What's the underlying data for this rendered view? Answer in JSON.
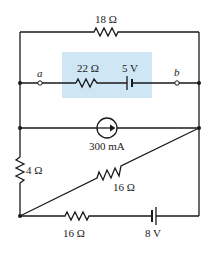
{
  "diagram": {
    "type": "circuit",
    "highlight_color": "#cfe6f5",
    "wire_color": "#1a1a1a",
    "components": {
      "r_top": {
        "label": "18 Ω",
        "type": "resistor"
      },
      "r_mid": {
        "label": "22 Ω",
        "type": "resistor"
      },
      "v_mid": {
        "label": "5 V",
        "type": "battery"
      },
      "i_src": {
        "label": "300 mA",
        "type": "current-source",
        "direction": "right"
      },
      "r_left": {
        "label": "4 Ω",
        "type": "resistor"
      },
      "r_diag": {
        "label": "16 Ω",
        "type": "resistor"
      },
      "r_bot": {
        "label": "16 Ω",
        "type": "resistor"
      },
      "v_bot": {
        "label": "8 V",
        "type": "battery"
      }
    },
    "terminals": {
      "a": {
        "label": "a"
      },
      "b": {
        "label": "b"
      }
    }
  }
}
